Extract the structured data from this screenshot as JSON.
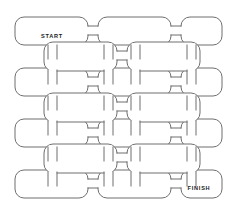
{
  "canvas": {
    "width": 236,
    "height": 215,
    "background": "#ffffff"
  },
  "maze": {
    "stroke_color": "#6f6f6f",
    "fill_color": "#ffffff",
    "stroke_width": 1,
    "corner_radius": 9,
    "grid_columns": 3,
    "grid_rows": 4,
    "inner_grid_columns": 2,
    "inner_grid_rows": 3,
    "main_cells": [
      {
        "id": "cell-r0-c0",
        "x": 15,
        "y": 17,
        "w": 73,
        "h": 28,
        "label": "START"
      },
      {
        "id": "cell-r0-c1",
        "x": 98,
        "y": 17,
        "w": 73,
        "h": 28,
        "label": ""
      },
      {
        "id": "cell-r0-c2",
        "x": 181,
        "y": 17,
        "w": 41,
        "h": 28,
        "label": ""
      },
      {
        "id": "cell-r1-c0",
        "x": 15,
        "y": 68,
        "w": 73,
        "h": 28,
        "label": ""
      },
      {
        "id": "cell-r1-c1",
        "x": 98,
        "y": 68,
        "w": 73,
        "h": 28,
        "label": ""
      },
      {
        "id": "cell-r1-c2",
        "x": 181,
        "y": 68,
        "w": 41,
        "h": 28,
        "label": ""
      },
      {
        "id": "cell-r2-c0",
        "x": 15,
        "y": 119,
        "w": 73,
        "h": 28,
        "label": ""
      },
      {
        "id": "cell-r2-c1",
        "x": 98,
        "y": 119,
        "w": 73,
        "h": 28,
        "label": ""
      },
      {
        "id": "cell-r2-c2",
        "x": 181,
        "y": 119,
        "w": 41,
        "h": 28,
        "label": ""
      },
      {
        "id": "cell-r3-c0",
        "x": 15,
        "y": 170,
        "w": 73,
        "h": 28,
        "label": ""
      },
      {
        "id": "cell-r3-c1",
        "x": 98,
        "y": 170,
        "w": 73,
        "h": 28,
        "label": ""
      },
      {
        "id": "cell-r3-c2",
        "x": 181,
        "y": 170,
        "w": 41,
        "h": 28,
        "label": "FINISH"
      }
    ],
    "offset_cells": [
      {
        "id": "icell-r0-c0",
        "x": 44,
        "y": 42,
        "w": 73,
        "h": 29,
        "label": ""
      },
      {
        "id": "icell-r0-c1",
        "x": 127,
        "y": 42,
        "w": 73,
        "h": 29,
        "label": ""
      },
      {
        "id": "icell-r1-c0",
        "x": 44,
        "y": 93,
        "w": 73,
        "h": 29,
        "label": ""
      },
      {
        "id": "icell-r1-c1",
        "x": 127,
        "y": 93,
        "w": 73,
        "h": 29,
        "label": ""
      },
      {
        "id": "icell-r2-c0",
        "x": 44,
        "y": 144,
        "w": 73,
        "h": 29,
        "label": ""
      },
      {
        "id": "icell-r2-c1",
        "x": 127,
        "y": 144,
        "w": 73,
        "h": 29,
        "label": ""
      }
    ],
    "horizontal_links": [
      {
        "id": "hlink-r0-a",
        "x": 88,
        "y": 26,
        "w": 10,
        "h": 9
      },
      {
        "id": "hlink-r0-b",
        "x": 171,
        "y": 26,
        "w": 10,
        "h": 9
      },
      {
        "id": "hlink-i0-a",
        "x": 117,
        "y": 51,
        "w": 10,
        "h": 9
      },
      {
        "id": "hlink-r1-a",
        "x": 88,
        "y": 77,
        "w": 10,
        "h": 9
      },
      {
        "id": "hlink-r1-b",
        "x": 171,
        "y": 77,
        "w": 10,
        "h": 9
      },
      {
        "id": "hlink-i1-a",
        "x": 117,
        "y": 102,
        "w": 10,
        "h": 9
      },
      {
        "id": "hlink-r2-a",
        "x": 88,
        "y": 128,
        "w": 10,
        "h": 9
      },
      {
        "id": "hlink-r2-b",
        "x": 171,
        "y": 128,
        "w": 10,
        "h": 9
      },
      {
        "id": "hlink-i2-a",
        "x": 117,
        "y": 153,
        "w": 10,
        "h": 9
      },
      {
        "id": "hlink-r3-a",
        "x": 88,
        "y": 179,
        "w": 10,
        "h": 9
      },
      {
        "id": "hlink-r3-b",
        "x": 171,
        "y": 179,
        "w": 10,
        "h": 9
      }
    ],
    "vertical_links": [
      {
        "id": "vlink-c0-r0",
        "x": 48,
        "y": 45,
        "w": 9,
        "h": 14
      },
      {
        "id": "vlink-c1-r0",
        "x": 104,
        "y": 45,
        "w": 9,
        "h": 14
      },
      {
        "id": "vlink-c2-r0",
        "x": 131,
        "y": 45,
        "w": 9,
        "h": 14
      },
      {
        "id": "vlink-c3-r0",
        "x": 187,
        "y": 45,
        "w": 9,
        "h": 14
      },
      {
        "id": "vlink-c0-r1",
        "x": 48,
        "y": 70,
        "w": 9,
        "h": 14
      },
      {
        "id": "vlink-c1-r1",
        "x": 104,
        "y": 70,
        "w": 9,
        "h": 14
      },
      {
        "id": "vlink-c2-r1",
        "x": 131,
        "y": 70,
        "w": 9,
        "h": 14
      },
      {
        "id": "vlink-c3-r1",
        "x": 187,
        "y": 70,
        "w": 9,
        "h": 14
      },
      {
        "id": "vlink-c0-r2",
        "x": 48,
        "y": 96,
        "w": 9,
        "h": 14
      },
      {
        "id": "vlink-c1-r2",
        "x": 104,
        "y": 96,
        "w": 9,
        "h": 14
      },
      {
        "id": "vlink-c2-r2",
        "x": 131,
        "y": 96,
        "w": 9,
        "h": 14
      },
      {
        "id": "vlink-c3-r2",
        "x": 187,
        "y": 96,
        "w": 9,
        "h": 14
      },
      {
        "id": "vlink-c0-r3",
        "x": 48,
        "y": 121,
        "w": 9,
        "h": 14
      },
      {
        "id": "vlink-c1-r3",
        "x": 104,
        "y": 121,
        "w": 9,
        "h": 14
      },
      {
        "id": "vlink-c2-r3",
        "x": 131,
        "y": 121,
        "w": 9,
        "h": 14
      },
      {
        "id": "vlink-c3-r3",
        "x": 187,
        "y": 121,
        "w": 9,
        "h": 14
      },
      {
        "id": "vlink-c0-r4",
        "x": 48,
        "y": 147,
        "w": 9,
        "h": 14
      },
      {
        "id": "vlink-c1-r4",
        "x": 104,
        "y": 147,
        "w": 9,
        "h": 14
      },
      {
        "id": "vlink-c2-r4",
        "x": 131,
        "y": 147,
        "w": 9,
        "h": 14
      },
      {
        "id": "vlink-c3-r4",
        "x": 187,
        "y": 147,
        "w": 9,
        "h": 14
      },
      {
        "id": "vlink-c0-r5",
        "x": 48,
        "y": 172,
        "w": 9,
        "h": 14
      },
      {
        "id": "vlink-c1-r5",
        "x": 104,
        "y": 172,
        "w": 9,
        "h": 14
      },
      {
        "id": "vlink-c2-r5",
        "x": 131,
        "y": 172,
        "w": 9,
        "h": 14
      },
      {
        "id": "vlink-c3-r5",
        "x": 187,
        "y": 172,
        "w": 9,
        "h": 14
      }
    ],
    "labels": {
      "start": "START",
      "finish": "FINISH",
      "start_x": 52,
      "start_y": 37,
      "finish_x": 199,
      "finish_y": 189
    }
  }
}
